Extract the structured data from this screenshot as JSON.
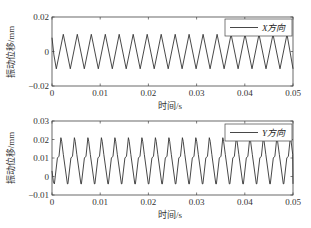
{
  "chart_data": [
    {
      "type": "line",
      "title": "",
      "xlabel": "时间/s",
      "ylabel": "振动位移/mm",
      "xlim": [
        0,
        0.05
      ],
      "ylim": [
        -0.02,
        0.02
      ],
      "xticks": [
        "0",
        "0.01",
        "0.02",
        "0.03",
        "0.04",
        "0.05"
      ],
      "yticks": [
        "-0.02",
        "0",
        "0.02"
      ],
      "grid": false,
      "legend_position": "upper right",
      "series": [
        {
          "name": "X方向",
          "color": "#333333",
          "waveform": "triangular periodic",
          "period_s": 0.0029,
          "peak": 0.01,
          "trough": -0.01,
          "start_value": 0.008
        }
      ]
    },
    {
      "type": "line",
      "title": "",
      "xlabel": "时间/s",
      "ylabel": "振动位移/mm",
      "xlim": [
        0,
        0.05
      ],
      "ylim": [
        -0.01,
        0.03
      ],
      "xticks": [
        "0",
        "0.01",
        "0.02",
        "0.03",
        "0.04",
        "0.05"
      ],
      "yticks": [
        "-0.01",
        "0",
        "0.01",
        "0.02",
        "0.03"
      ],
      "grid": false,
      "legend_position": "upper right",
      "series": [
        {
          "name": "Y方向",
          "color": "#333333",
          "waveform": "periodic with shoulder on rising edge",
          "period_s": 0.0028,
          "peak": 0.021,
          "shoulder": 0.01,
          "trough": -0.004,
          "start_value": 0.003
        }
      ]
    }
  ],
  "plots": {
    "top": {
      "ylabel": "振动位移/mm",
      "xlabel": "时间/s",
      "legend": "X方向",
      "yticks": [
        "0.02",
        "0",
        "−0.02"
      ],
      "xticks": [
        "0",
        "0.01",
        "0.02",
        "0.03",
        "0.04",
        "0.05"
      ]
    },
    "bottom": {
      "ylabel": "振动位移/mm",
      "xlabel": "时间/s",
      "legend": "Y方向",
      "yticks": [
        "0.03",
        "0.02",
        "0.01",
        "0",
        "−0.01"
      ],
      "xticks": [
        "0",
        "0.01",
        "0.02",
        "0.03",
        "0.04",
        "0.05"
      ]
    }
  }
}
